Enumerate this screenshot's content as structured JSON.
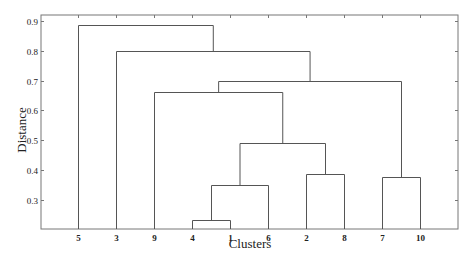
{
  "chart_data": {
    "type": "dendrogram",
    "title": "",
    "xlabel": "Clusters",
    "ylabel": "Distance",
    "ylim": [
      0.2,
      0.925
    ],
    "yticks": [
      0.3,
      0.4,
      0.5,
      0.6,
      0.7,
      0.8,
      0.9
    ],
    "ytick_labels": [
      "0.3",
      "0.4",
      "0.5",
      "0.6",
      "0.7",
      "0.8",
      "0.9"
    ],
    "leaf_order": [
      "5",
      "3",
      "9",
      "4",
      "1",
      "6",
      "2",
      "8",
      "7",
      "10"
    ],
    "merges": [
      {
        "left": "4",
        "right": "1",
        "height": 0.234
      },
      {
        "left": "(4,1)",
        "right": "6",
        "height": 0.35
      },
      {
        "left": "7",
        "right": "10",
        "height": 0.377
      },
      {
        "left": "2",
        "right": "8",
        "height": 0.387
      },
      {
        "left": "((4,1),6)",
        "right": "(2,8)",
        "height": 0.49
      },
      {
        "left": "9",
        "right": "(((4,1),6),(2,8))",
        "height": 0.662
      },
      {
        "left": "(9,...)",
        "right": "(7,10)",
        "height": 0.7
      },
      {
        "left": "3",
        "right": "((9,...),(7,10))",
        "height": 0.8
      },
      {
        "left": "5",
        "right": "(3,...)",
        "height": 0.887
      }
    ],
    "grid": false,
    "legend": null
  },
  "colors": {
    "line": "#555555",
    "axis": "#777777",
    "text": "#222222"
  }
}
